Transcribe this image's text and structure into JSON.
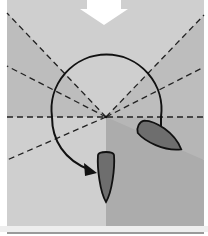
{
  "diagram": {
    "type": "sailing-maneuver",
    "colors": {
      "background": "#ffffff",
      "frame_light": "#cfcfcf",
      "sector_mid": "#b9b9b9",
      "quadrant_dark": "#ababab",
      "bottom_strip": "#e6e6e6",
      "rule_line": "#9a9a9a",
      "boat_fill": "#6e6e6e",
      "stroke": "#111111",
      "wind_arrow": "#ffffff"
    },
    "center": {
      "x": 106,
      "y": 117
    },
    "wind_arrow": {
      "icon": "wind-arrow-icon",
      "direction": "down"
    },
    "boats": [
      {
        "id": "boat-start",
        "label": "",
        "cx": 160,
        "cy": 136,
        "angle_deg": 28
      },
      {
        "id": "boat-end",
        "label": "",
        "cx": 106,
        "cy": 174,
        "angle_deg": 0
      }
    ],
    "maneuver_arrow": {
      "icon": "circular-arrow-icon",
      "radius": 55
    }
  }
}
